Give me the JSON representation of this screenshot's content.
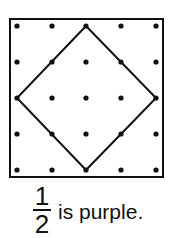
{
  "diagram": {
    "type": "geoboard",
    "grid": {
      "rows": 5,
      "cols": 5
    },
    "square": {
      "x": 10,
      "y": 19,
      "w": 153,
      "h": 158
    },
    "dot_xs": [
      17,
      52,
      86,
      121,
      156
    ],
    "dot_ys": [
      26,
      62,
      98,
      134,
      170
    ],
    "shape": {
      "name": "diamond",
      "vertices": [
        [
          86,
          26
        ],
        [
          156,
          98
        ],
        [
          86,
          170
        ],
        [
          17,
          98
        ]
      ]
    },
    "colors": {
      "line": "#111111",
      "dot": "#111111",
      "background": "#ffffff"
    }
  },
  "caption": {
    "numerator": "1",
    "denominator": "2",
    "text": "is purple."
  }
}
